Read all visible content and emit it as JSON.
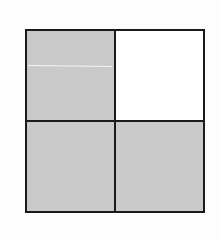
{
  "figure": {
    "rows": 2,
    "cols": 2,
    "cells": [
      {
        "position": "top-left",
        "shaded": true,
        "color": "#c9c9c9"
      },
      {
        "position": "top-right",
        "shaded": false,
        "color": "#ffffff"
      },
      {
        "position": "bottom-left",
        "shaded": true,
        "color": "#c9c9c9"
      },
      {
        "position": "bottom-right",
        "shaded": true,
        "color": "#c9c9c9"
      }
    ],
    "shaded_count": 3,
    "total_count": 4,
    "border_color": "#1a1a1a"
  }
}
